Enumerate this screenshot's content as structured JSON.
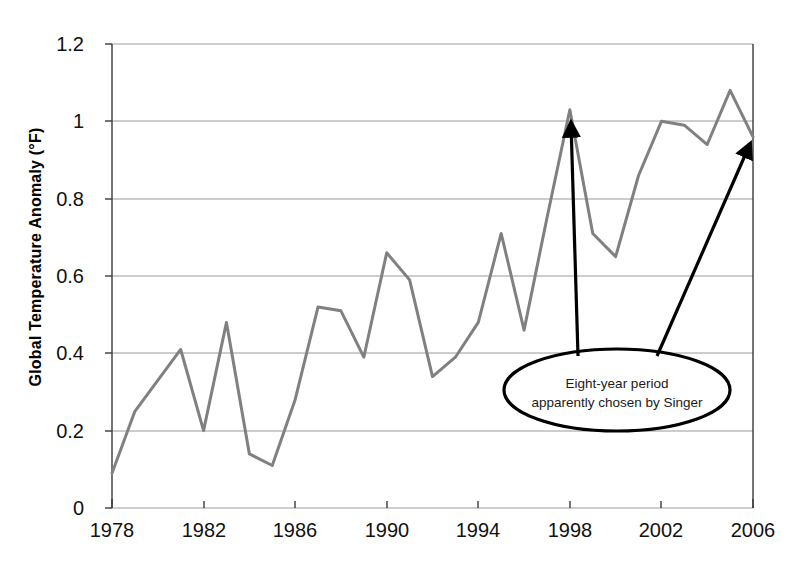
{
  "chart_data": {
    "type": "line",
    "title": "",
    "xlabel": "",
    "ylabel": "Global Temperature Anomaly (°F)",
    "xlim": [
      1978,
      2006
    ],
    "ylim": [
      0,
      1.2
    ],
    "grid": true,
    "legend": "none",
    "line_color": "#808080",
    "annotation_color": "#000000",
    "x_tick_labels": [
      "1978",
      "1982",
      "1986",
      "1990",
      "1994",
      "1998",
      "2002",
      "2006"
    ],
    "x_tick_values": [
      1978,
      1982,
      1986,
      1990,
      1994,
      1998,
      2002,
      2006
    ],
    "y_tick_labels": [
      "0",
      "0.2",
      "0.4",
      "0.6",
      "0.8",
      "1",
      "1.2"
    ],
    "y_tick_values": [
      0,
      0.2,
      0.4,
      0.6,
      0.8,
      1,
      1.2
    ],
    "x": [
      1978,
      1979,
      1980,
      1981,
      1982,
      1983,
      1984,
      1985,
      1986,
      1987,
      1988,
      1989,
      1990,
      1991,
      1992,
      1993,
      1994,
      1995,
      1996,
      1997,
      1998,
      1999,
      2000,
      2001,
      2002,
      2003,
      2004,
      2005,
      2006
    ],
    "values": [
      0.09,
      0.25,
      0.33,
      0.41,
      0.2,
      0.48,
      0.14,
      0.11,
      0.28,
      0.52,
      0.51,
      0.39,
      0.66,
      0.59,
      0.34,
      0.39,
      0.48,
      0.71,
      0.46,
      0.75,
      1.03,
      0.71,
      0.65,
      0.86,
      1.0,
      0.99,
      0.94,
      1.08,
      0.96
    ],
    "series": [
      {
        "name": "Global Temperature Anomaly",
        "values": [
          0.09,
          0.25,
          0.33,
          0.41,
          0.2,
          0.48,
          0.14,
          0.11,
          0.28,
          0.52,
          0.51,
          0.39,
          0.66,
          0.59,
          0.34,
          0.39,
          0.48,
          0.71,
          0.46,
          0.75,
          1.03,
          0.71,
          0.65,
          0.86,
          1.0,
          0.99,
          0.94,
          1.08,
          0.96
        ]
      }
    ],
    "annotations": [
      {
        "name": "eight-year-period-callout",
        "line1": "Eight-year period",
        "line2": "apparently chosen by Singer",
        "arrow_targets": [
          {
            "x": 1998,
            "y": 1.03
          },
          {
            "x": 2006,
            "y": 0.96
          }
        ]
      }
    ]
  }
}
